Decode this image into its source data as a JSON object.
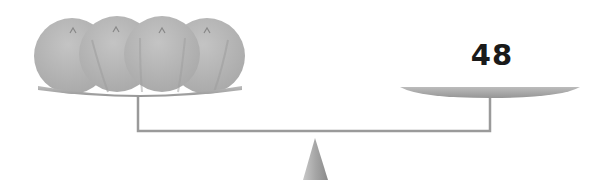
{
  "diagram": {
    "type": "balance-scale",
    "left_pan": {
      "contents": "balls",
      "ball_count": 4,
      "ball_label": ""
    },
    "right_pan": {
      "weight_label": "48"
    },
    "colors": {
      "ball_fill": "#b3b3b3",
      "ball_shadow": "#a0a0a0",
      "pan_fill": "#a9a9a9",
      "beam": "#9a9a9a",
      "fulcrum_light": "#bdbdbd",
      "fulcrum_dark": "#8f8f8f",
      "label_text": "#1a1a1a"
    }
  }
}
